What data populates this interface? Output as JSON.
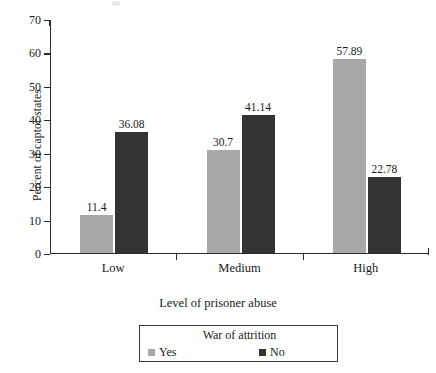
{
  "chart_data": {
    "type": "bar",
    "title": "",
    "xlabel": "Level of prisoner abuse",
    "ylabel": "Percent of captor states",
    "categories": [
      "Low",
      "Medium",
      "High"
    ],
    "series": [
      {
        "name": "Yes",
        "color": "#a8a8a8",
        "values": [
          11.4,
          30.7,
          57.89
        ],
        "labels": [
          "11.4",
          "30.7",
          "57.89"
        ]
      },
      {
        "name": "No",
        "color": "#333333",
        "values": [
          36.08,
          41.14,
          22.78
        ],
        "labels": [
          "36.08",
          "41.14",
          "22.78"
        ]
      }
    ],
    "ylim": [
      0,
      70
    ],
    "yticks": [
      0,
      10,
      20,
      30,
      40,
      50,
      60,
      70
    ],
    "ytick_labels": [
      "0",
      "10",
      "20",
      "30",
      "40",
      "50",
      "60",
      "70"
    ],
    "grid": false,
    "legend_position": "bottom-center",
    "legend_title": "War of attrition"
  },
  "legend": {
    "title": "War of attrition",
    "entries": [
      {
        "label": "Yes",
        "swatch": "yes"
      },
      {
        "label": "No",
        "swatch": "no"
      }
    ]
  },
  "axes": {
    "y_title": "Percent of captor states",
    "x_title": "Level of prisoner abuse"
  }
}
